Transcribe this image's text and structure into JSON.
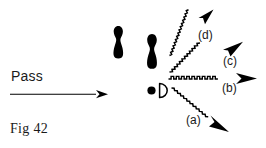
{
  "figure": {
    "id": "Fig 42",
    "caption": "Fig 42",
    "pass_label": "Pass",
    "ink_color": "#000000",
    "background_color": "#ffffff",
    "width": 266,
    "height": 148
  },
  "labels": {
    "a": "(a)",
    "b": "(b)",
    "c": "(c)",
    "d": "(d)"
  },
  "objects": {
    "pin_front": "bowling-pin",
    "pin_back": "bowling-pin",
    "ball": "ball-dot",
    "marker": "D"
  },
  "arrows": {
    "pass": {
      "style": "straight",
      "direction": "right"
    },
    "a": {
      "style": "wavy",
      "direction": "down-right"
    },
    "b": {
      "style": "wavy",
      "direction": "right"
    },
    "c": {
      "style": "wavy",
      "direction": "up-right"
    },
    "d": {
      "style": "wavy",
      "direction": "up-right"
    }
  }
}
